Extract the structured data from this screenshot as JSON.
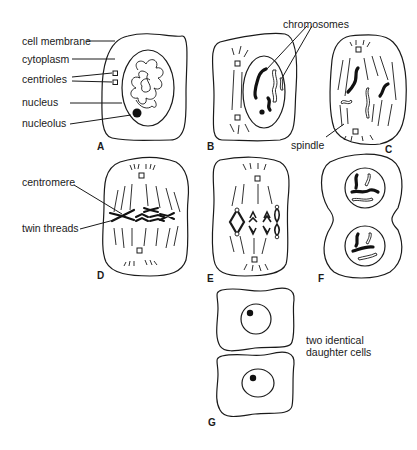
{
  "figure": {
    "panels": {
      "A": {
        "letter": "A"
      },
      "B": {
        "letter": "B"
      },
      "C": {
        "letter": "C"
      },
      "D": {
        "letter": "D"
      },
      "E": {
        "letter": "E"
      },
      "F": {
        "letter": "F"
      },
      "G": {
        "letter": "G"
      }
    },
    "labels": {
      "cell_membrane": "cell membrane",
      "cytoplasm": "cytoplasm",
      "centrioles": "centrioles",
      "nucleus": "nucleus",
      "nucleolus": "nucleolus",
      "chromosomes": "chromosomes",
      "spindle": "spindle",
      "centromere": "centromere",
      "twin_threads": "twin threads",
      "daughter_cells_line1": "two identical",
      "daughter_cells_line2": "daughter cells"
    },
    "colors": {
      "ink": "#1a1a1a",
      "background": "#ffffff"
    }
  }
}
